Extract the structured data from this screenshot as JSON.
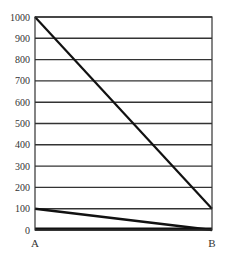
{
  "chart_data": {
    "type": "line",
    "title": "",
    "xlabel": "",
    "ylabel": "",
    "categories": [
      "A",
      "B"
    ],
    "series": [
      {
        "name": "Series 1",
        "values": [
          1000,
          100
        ]
      },
      {
        "name": "Series 2",
        "values": [
          100,
          0
        ]
      },
      {
        "name": "Series 3",
        "values": [
          0,
          0
        ]
      }
    ],
    "ylim": [
      0,
      1000
    ],
    "yticks": [
      0,
      100,
      200,
      300,
      400,
      500,
      600,
      700,
      800,
      900,
      1000
    ],
    "grid": true,
    "legend": "none"
  },
  "axis": {
    "y_labels": [
      "0",
      "100",
      "200",
      "300",
      "400",
      "500",
      "600",
      "700",
      "800",
      "900",
      "1000"
    ],
    "x_labels": [
      "A",
      "B"
    ]
  }
}
